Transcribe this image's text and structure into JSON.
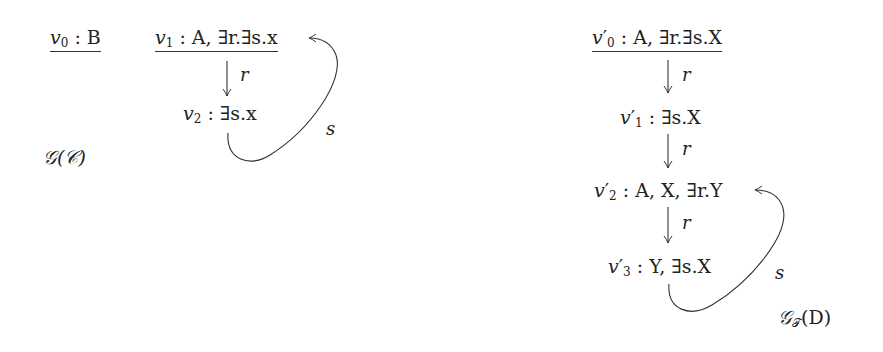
{
  "graphs": [
    {
      "name": "𝒢(𝒞)",
      "nodes": [
        {
          "id": "v0",
          "var": "v",
          "sub": "0",
          "prime": "",
          "concepts": " : B",
          "root": true
        },
        {
          "id": "v1",
          "var": "v",
          "sub": "1",
          "prime": "",
          "concepts": " : A, ∃r.∃s.x",
          "root": true
        },
        {
          "id": "v2",
          "var": "v",
          "sub": "2",
          "prime": "",
          "concepts": " : ∃s.x",
          "root": false
        }
      ],
      "edges": [
        {
          "from": "v1",
          "to": "v2",
          "label": "r"
        },
        {
          "from": "v2",
          "to": "v1",
          "label": "s"
        }
      ]
    },
    {
      "name_main": "𝒢",
      "name_sub": "𝒯",
      "name_arg": "(D)",
      "nodes": [
        {
          "id": "v0p",
          "var": "v",
          "sub": "0",
          "prime": "′",
          "concepts": " : A, ∃r.∃s.X",
          "root": true
        },
        {
          "id": "v1p",
          "var": "v",
          "sub": "1",
          "prime": "′",
          "concepts": " : ∃s.X",
          "root": false
        },
        {
          "id": "v2p",
          "var": "v",
          "sub": "2",
          "prime": "′",
          "concepts": " : A, X, ∃r.Y",
          "root": false
        },
        {
          "id": "v3p",
          "var": "v",
          "sub": "3",
          "prime": "′",
          "concepts": " : Y, ∃s.X",
          "root": false
        }
      ],
      "edges": [
        {
          "from": "v0p",
          "to": "v1p",
          "label": "r"
        },
        {
          "from": "v1p",
          "to": "v2p",
          "label": "r"
        },
        {
          "from": "v2p",
          "to": "v3p",
          "label": "r"
        },
        {
          "from": "v3p",
          "to": "v2p",
          "label": "s"
        }
      ]
    }
  ]
}
